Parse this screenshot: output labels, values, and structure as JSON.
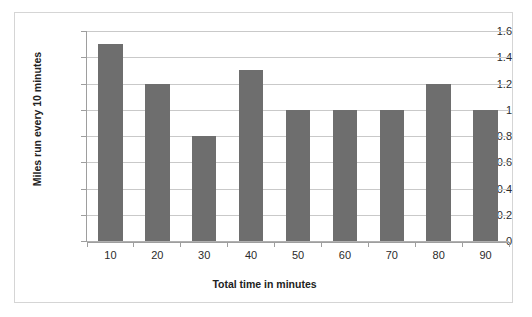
{
  "chart_data": {
    "type": "bar",
    "title": "",
    "categories": [
      "10",
      "20",
      "30",
      "40",
      "50",
      "60",
      "70",
      "80",
      "90"
    ],
    "values": [
      1.5,
      1.2,
      0.8,
      1.3,
      1.0,
      1.0,
      1.0,
      1.2,
      1.0
    ],
    "xlabel": "Total time in minutes",
    "ylabel": "Miles run every 10 minutes",
    "ylim": [
      0,
      1.6
    ],
    "yticks": [
      "0",
      "0.2",
      "0.4",
      "0.6",
      "0.8",
      "1",
      "1.2",
      "1.4",
      "1.6"
    ],
    "ytick_values": [
      0,
      0.2,
      0.4,
      0.6,
      0.8,
      1,
      1.2,
      1.4,
      1.6
    ],
    "grid": true,
    "legend": false,
    "bar_color": "#6e6e6e",
    "gridline_color": "#c9c9c9",
    "axis_color": "#9e9e9e",
    "frame_color": "#d5d5d5",
    "background_color": "#ffffff"
  }
}
